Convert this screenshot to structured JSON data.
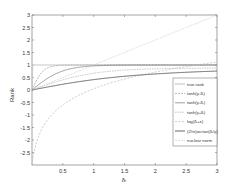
{
  "chart_data": {
    "type": "line",
    "title": "",
    "xlabel": "δ_i",
    "ylabel": "Rank",
    "xlim": [
      0,
      3
    ],
    "ylim": [
      -3,
      3
    ],
    "grid": false,
    "legend_position": "lower right (inside)",
    "x_ticks": [
      "0.5",
      "1",
      "1.5",
      "2",
      "2.5",
      "3"
    ],
    "y_ticks": [
      "3",
      "2.5",
      "2",
      "1.5",
      "1",
      "0.5",
      "0",
      "-0.5",
      "-1",
      "-1.5",
      "-2",
      "-2.5"
    ],
    "x": [
      0,
      0.25,
      0.5,
      0.75,
      1,
      1.5,
      2,
      2.5,
      3
    ],
    "series": [
      {
        "name": "true rank",
        "values": [
          0,
          1,
          1,
          1,
          1,
          1,
          1,
          1,
          1
        ]
      },
      {
        "name": "tanh(γ1δi)",
        "values": [
          0,
          0.76,
          0.96,
          0.99,
          1,
          1,
          1,
          1,
          1
        ]
      },
      {
        "name": "tanh(γ2δi)",
        "values": [
          0,
          0.46,
          0.76,
          0.9,
          0.96,
          1,
          1,
          1,
          1
        ]
      },
      {
        "name": "tanh(γ3δi)",
        "values": [
          0,
          0.24,
          0.46,
          0.63,
          0.76,
          0.9,
          0.96,
          0.99,
          1
        ]
      },
      {
        "name": "log(δi+ε)",
        "values": [
          -3,
          -1.39,
          -0.69,
          -0.29,
          0,
          0.41,
          0.69,
          0.92,
          1.1
        ]
      },
      {
        "name": "(2/π)arctan(δi/γ)",
        "values": [
          0,
          0.1,
          0.2,
          0.28,
          0.36,
          0.5,
          0.59,
          0.66,
          0.71
        ]
      },
      {
        "name": "nuclear norm",
        "values": [
          0,
          0.25,
          0.5,
          0.75,
          1,
          1.5,
          2,
          2.5,
          3
        ]
      }
    ]
  },
  "legend": [
    "true rank",
    "tanh(γ₁δᵢ)",
    "tanh(γ₂δᵢ)",
    "tanh(γ₃δᵢ)",
    "log(δᵢ+ε)",
    "(2/π)arctan(δᵢ/γ)",
    "nuclear norm"
  ],
  "axes": {
    "xlabel": "δᵢ",
    "ylabel": "Rank"
  }
}
